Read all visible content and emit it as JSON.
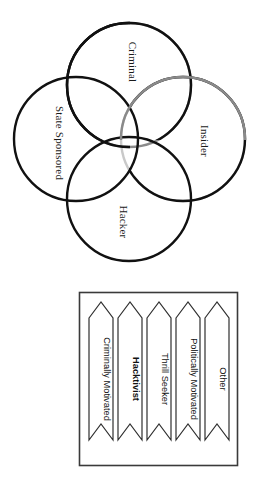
{
  "figure": {
    "orientation": "rotated-90-clockwise",
    "background_color": "#ffffff"
  },
  "venn": {
    "type": "four-circle-venn",
    "circles": [
      {
        "label": "Criminal",
        "position": "top",
        "stroke_color": "#111111",
        "cx": 129,
        "cy": 85,
        "r": 62
      },
      {
        "label": "State Sponsored",
        "position": "left",
        "stroke_color": "#111111",
        "cx": 76,
        "cy": 139,
        "r": 62
      },
      {
        "label": "Insider",
        "position": "right",
        "stroke_color": "#111111",
        "cx": 183,
        "cy": 139,
        "r": 62
      },
      {
        "label": "Hacker",
        "position": "bottom",
        "stroke_color": "#111111",
        "cx": 129,
        "cy": 199,
        "r": 62
      }
    ]
  },
  "categories_box": {
    "border_color": "#3a3a3a",
    "items": [
      {
        "label": "Criminally Motivated",
        "emphasis": "normal"
      },
      {
        "label": "Hacktivist",
        "emphasis": "bold"
      },
      {
        "label": "Thrill Seeker",
        "emphasis": "normal"
      },
      {
        "label": "Politically Motivated",
        "emphasis": "normal"
      },
      {
        "label": "Other",
        "emphasis": "normal"
      }
    ]
  }
}
